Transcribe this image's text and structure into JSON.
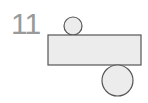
{
  "problem": {
    "number": "11"
  },
  "figure": {
    "fill_color": "#ececec",
    "stroke_color": "#555555",
    "rectangle": {
      "x": 48,
      "y": 35,
      "width": 93,
      "height": 30
    },
    "small_circle": {
      "cx": 73,
      "cy": 26,
      "r": 9
    },
    "large_circle": {
      "cx": 117.5,
      "cy": 80.5,
      "r": 15.5
    }
  }
}
